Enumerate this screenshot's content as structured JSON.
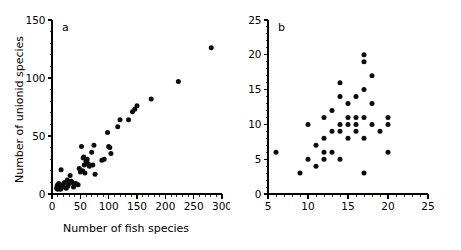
{
  "figure": {
    "background": "#ffffff",
    "dot_color": "#0b0b0b",
    "axis_color": "#000000"
  },
  "panels": [
    {
      "id": "a",
      "letter": "a",
      "xlabel": "Number of fish species",
      "ylabel": "Number of unionid species"
    },
    {
      "id": "b",
      "letter": "b",
      "xlabel": "Number of fish species",
      "ylabel": ""
    }
  ],
  "chart_data": [
    {
      "type": "scatter",
      "panel": "a",
      "title": "",
      "xlabel": "Number of fish species",
      "ylabel": "Number of unionid species",
      "xlim": [
        0,
        300
      ],
      "ylim": [
        0,
        150
      ],
      "xticks": [
        0,
        50,
        100,
        150,
        200,
        250,
        300
      ],
      "yticks": [
        0,
        50,
        100,
        150
      ],
      "xtick_labels": [
        "0",
        "50",
        "100",
        "150",
        "200",
        "250",
        "300"
      ],
      "ytick_labels": [
        "0",
        "50",
        "100",
        "150"
      ],
      "xminor_step": 10,
      "yminor_step": 10,
      "grid": false,
      "legend": null,
      "points": [
        [
          8,
          5
        ],
        [
          9,
          7
        ],
        [
          10,
          4
        ],
        [
          10,
          8
        ],
        [
          11,
          6
        ],
        [
          12,
          5
        ],
        [
          12,
          9
        ],
        [
          13,
          7
        ],
        [
          14,
          6
        ],
        [
          15,
          4
        ],
        [
          16,
          21
        ],
        [
          18,
          8
        ],
        [
          20,
          6
        ],
        [
          22,
          10
        ],
        [
          25,
          5
        ],
        [
          27,
          12
        ],
        [
          28,
          7
        ],
        [
          30,
          9
        ],
        [
          32,
          16
        ],
        [
          34,
          11
        ],
        [
          36,
          10
        ],
        [
          38,
          6
        ],
        [
          42,
          9
        ],
        [
          46,
          8
        ],
        [
          48,
          22
        ],
        [
          50,
          19
        ],
        [
          52,
          41
        ],
        [
          54,
          20
        ],
        [
          55,
          31
        ],
        [
          56,
          32
        ],
        [
          57,
          25
        ],
        [
          58,
          18
        ],
        [
          60,
          28
        ],
        [
          62,
          30
        ],
        [
          64,
          26
        ],
        [
          66,
          24
        ],
        [
          70,
          36
        ],
        [
          72,
          25
        ],
        [
          74,
          42
        ],
        [
          76,
          17
        ],
        [
          88,
          29
        ],
        [
          92,
          30
        ],
        [
          98,
          53
        ],
        [
          100,
          41
        ],
        [
          102,
          40
        ],
        [
          104,
          35
        ],
        [
          116,
          58
        ],
        [
          120,
          64
        ],
        [
          135,
          64
        ],
        [
          142,
          71
        ],
        [
          146,
          73
        ],
        [
          150,
          76
        ],
        [
          175,
          82
        ],
        [
          223,
          97
        ],
        [
          281,
          126
        ]
      ]
    },
    {
      "type": "scatter",
      "panel": "b",
      "title": "",
      "xlabel": "Number of fish species",
      "ylabel": "",
      "xlim": [
        5,
        25
      ],
      "ylim": [
        0,
        25
      ],
      "xticks": [
        5,
        10,
        15,
        20,
        25
      ],
      "yticks": [
        0,
        5,
        10,
        15,
        20,
        25
      ],
      "xtick_labels": [
        "5",
        "10",
        "15",
        "20",
        "25"
      ],
      "ytick_labels": [
        "0",
        "5",
        "10",
        "15",
        "20",
        "25"
      ],
      "xminor_step": 1,
      "yminor_step": 1,
      "grid": false,
      "legend": null,
      "points": [
        [
          6,
          6
        ],
        [
          9,
          3
        ],
        [
          10,
          5
        ],
        [
          10,
          10
        ],
        [
          11,
          7
        ],
        [
          11,
          4
        ],
        [
          12,
          8
        ],
        [
          12,
          11
        ],
        [
          12,
          5
        ],
        [
          12,
          6
        ],
        [
          13,
          6
        ],
        [
          13,
          9
        ],
        [
          13,
          12
        ],
        [
          14,
          5
        ],
        [
          14,
          9
        ],
        [
          14,
          10
        ],
        [
          14,
          14
        ],
        [
          14,
          16
        ],
        [
          15,
          11
        ],
        [
          15,
          10
        ],
        [
          15,
          13
        ],
        [
          15,
          8
        ],
        [
          16,
          11
        ],
        [
          16,
          14
        ],
        [
          16,
          9
        ],
        [
          16,
          10
        ],
        [
          17,
          3
        ],
        [
          17,
          8
        ],
        [
          17,
          11
        ],
        [
          17,
          15
        ],
        [
          17,
          19
        ],
        [
          17,
          20
        ],
        [
          18,
          10
        ],
        [
          18,
          13
        ],
        [
          18,
          17
        ],
        [
          19,
          9
        ],
        [
          20,
          6
        ],
        [
          20,
          10
        ],
        [
          20,
          11
        ]
      ]
    }
  ]
}
